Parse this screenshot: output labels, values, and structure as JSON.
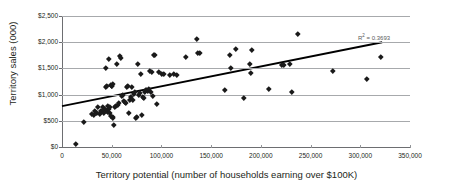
{
  "chart_data": {
    "type": "scatter",
    "title": "",
    "xlabel": "Territory potential (number of households earning over $100K)",
    "ylabel": "Territory sales (000)",
    "xlim": [
      0,
      350000
    ],
    "ylim": [
      0,
      2500
    ],
    "xticks": [
      0,
      50000,
      100000,
      150000,
      200000,
      250000,
      300000,
      350000
    ],
    "xtick_labels": [
      "0",
      "50,000",
      "100,000",
      "150,000",
      "200,000",
      "250,000",
      "300,000",
      "350,000"
    ],
    "yticks": [
      0,
      500,
      1000,
      1500,
      2000,
      2500
    ],
    "ytick_labels": [
      "$0",
      "$500",
      "$1,000",
      "$1,500",
      "$2,000",
      "$2,500"
    ],
    "grid": "horizontal",
    "legend": "none",
    "marker": "diamond",
    "marker_color": "#1a1a1a",
    "annotations": [
      {
        "name": "r-squared",
        "text": "R² = 0.3693",
        "x": 300000,
        "y": 2060
      }
    ],
    "trendline": {
      "type": "linear",
      "r_squared": 0.3693,
      "x_start": 0,
      "y_start": 780,
      "x_end": 322000,
      "y_end": 2000,
      "color": "#000000"
    },
    "points": [
      [
        14000,
        60
      ],
      [
        22000,
        490
      ],
      [
        30000,
        640
      ],
      [
        32000,
        610
      ],
      [
        33000,
        700
      ],
      [
        35000,
        660
      ],
      [
        36000,
        760
      ],
      [
        38000,
        640
      ],
      [
        39000,
        700
      ],
      [
        40000,
        690
      ],
      [
        41000,
        770
      ],
      [
        42000,
        650
      ],
      [
        43000,
        720
      ],
      [
        44000,
        1510
      ],
      [
        44500,
        1140
      ],
      [
        45000,
        1160
      ],
      [
        45500,
        700
      ],
      [
        46000,
        670
      ],
      [
        46500,
        780
      ],
      [
        47000,
        1680
      ],
      [
        47500,
        720
      ],
      [
        48000,
        770
      ],
      [
        48500,
        660
      ],
      [
        49000,
        590
      ],
      [
        49500,
        1190
      ],
      [
        50000,
        1170
      ],
      [
        50500,
        1160
      ],
      [
        50800,
        1200
      ],
      [
        51000,
        570
      ],
      [
        51500,
        560
      ],
      [
        52000,
        415
      ],
      [
        53000,
        760
      ],
      [
        54000,
        790
      ],
      [
        55000,
        1580
      ],
      [
        56000,
        800
      ],
      [
        57000,
        850
      ],
      [
        58000,
        1740
      ],
      [
        59000,
        1700
      ],
      [
        60000,
        980
      ],
      [
        61000,
        1000
      ],
      [
        62000,
        880
      ],
      [
        63000,
        870
      ],
      [
        64000,
        840
      ],
      [
        65000,
        1150
      ],
      [
        66000,
        1160
      ],
      [
        67000,
        660
      ],
      [
        68000,
        910
      ],
      [
        69000,
        950
      ],
      [
        70000,
        1150
      ],
      [
        71000,
        900
      ],
      [
        72000,
        1020
      ],
      [
        73000,
        1050
      ],
      [
        74000,
        560
      ],
      [
        75000,
        575
      ],
      [
        76000,
        1580
      ],
      [
        77000,
        1000
      ],
      [
        78000,
        1030
      ],
      [
        79000,
        1400
      ],
      [
        80000,
        620
      ],
      [
        81000,
        960
      ],
      [
        82000,
        940
      ],
      [
        83000,
        1060
      ],
      [
        84000,
        1090
      ],
      [
        85000,
        1100
      ],
      [
        86000,
        1080
      ],
      [
        87000,
        1110
      ],
      [
        88000,
        1450
      ],
      [
        89000,
        1060
      ],
      [
        90000,
        1430
      ],
      [
        91000,
        970
      ],
      [
        92000,
        1760
      ],
      [
        93000,
        1755
      ],
      [
        95000,
        820
      ],
      [
        97000,
        1440
      ],
      [
        100000,
        1400
      ],
      [
        102000,
        1390
      ],
      [
        108000,
        1380
      ],
      [
        112000,
        1400
      ],
      [
        115000,
        1385
      ],
      [
        125000,
        1720
      ],
      [
        136000,
        2060
      ],
      [
        137000,
        1800
      ],
      [
        139000,
        1805
      ],
      [
        164000,
        1090
      ],
      [
        169000,
        1760
      ],
      [
        170000,
        1520
      ],
      [
        175000,
        1880
      ],
      [
        183000,
        945
      ],
      [
        189000,
        1580
      ],
      [
        190000,
        1425
      ],
      [
        191000,
        1860
      ],
      [
        208000,
        1120
      ],
      [
        221000,
        1560
      ],
      [
        223000,
        1565
      ],
      [
        229000,
        1590
      ],
      [
        231000,
        1060
      ],
      [
        237000,
        2160
      ],
      [
        272000,
        1450
      ],
      [
        307000,
        1305
      ],
      [
        321000,
        1720
      ]
    ]
  }
}
